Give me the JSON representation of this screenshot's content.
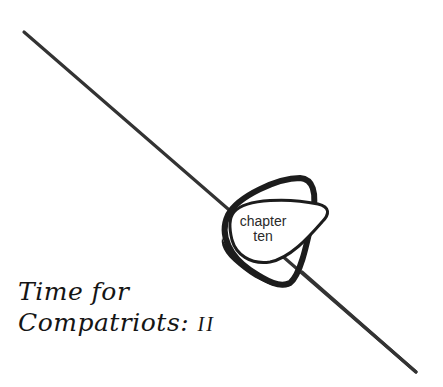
{
  "emblem": {
    "line1": "chapter",
    "line2": "ten"
  },
  "title": {
    "line1": "Time for",
    "line2_main": "Compatriots:",
    "line2_numeral": "II"
  },
  "colors": {
    "ink": "#1c1c1c",
    "line": "#333333",
    "background": "#ffffff"
  }
}
